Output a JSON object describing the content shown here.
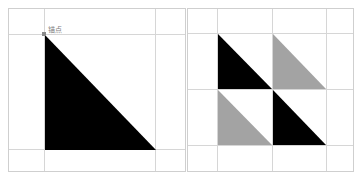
{
  "colors": {
    "black_fill": "#000000",
    "gray_fill": "#a3a3a3",
    "grid_line": "#d6d6d6",
    "panel_border": "#cfcfcf",
    "anchor": "#8a8a8a"
  },
  "left_panel": {
    "anchor_label": "锚点",
    "triangle": {
      "fill": "black",
      "points": "36,26 36,141 147,141"
    }
  },
  "right_panel": {
    "triangles": [
      {
        "position": "top-left",
        "fill": "black"
      },
      {
        "position": "top-right",
        "fill": "gray"
      },
      {
        "position": "bottom-left",
        "fill": "gray"
      },
      {
        "position": "bottom-right",
        "fill": "black"
      }
    ]
  }
}
